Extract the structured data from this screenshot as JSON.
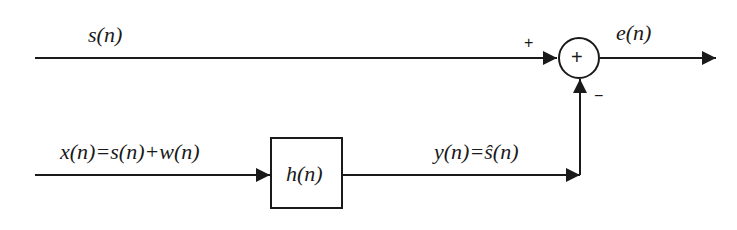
{
  "diagram": {
    "type": "block-diagram",
    "colors": {
      "line": "#1a1a1a",
      "background": "#ffffff"
    },
    "signals": {
      "desired": "s(n)",
      "input": "x(n)=s(n)+w(n)",
      "output": "y(n)=ŝ(n)",
      "error": "e(n)"
    },
    "blocks": {
      "filter": "h(n)",
      "summer": "+"
    },
    "summer_signs": {
      "top_input": "+",
      "bottom_input": "−"
    }
  }
}
